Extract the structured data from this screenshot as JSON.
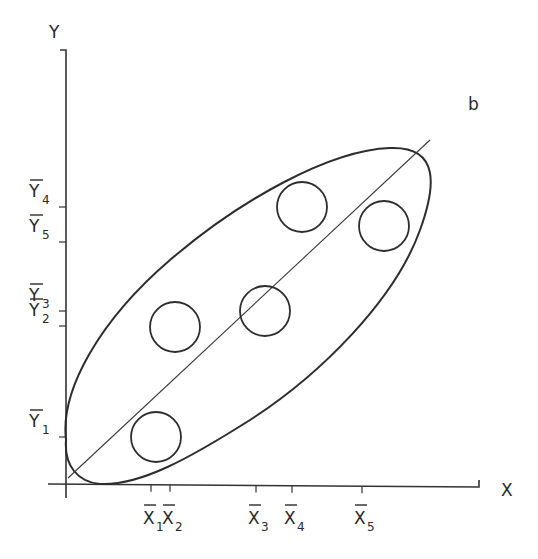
{
  "figure": {
    "panel_label": "b",
    "x_axis_label": "X",
    "y_axis_label": "Y",
    "colors": {
      "ink": "#2d2d2d",
      "background": "#ffffff"
    }
  },
  "x_ticks": [
    {
      "label": "X",
      "sub": "1",
      "pos": 151
    },
    {
      "label": "X",
      "sub": "2",
      "pos": 170
    },
    {
      "label": "X",
      "sub": "3",
      "pos": 256
    },
    {
      "label": "X",
      "sub": "4",
      "pos": 292
    },
    {
      "label": "X",
      "sub": "5",
      "pos": 362
    }
  ],
  "y_ticks": [
    {
      "label": "Y",
      "sub": "4",
      "pos": 207
    },
    {
      "label": "Y",
      "sub": "5",
      "pos": 242
    },
    {
      "label": "Y",
      "sub": "3",
      "pos": 311
    },
    {
      "label": "Y",
      "sub": "2",
      "pos": 326
    },
    {
      "label": "Y",
      "sub": "1",
      "pos": 437
    }
  ],
  "groups": [
    {
      "name": "group-1",
      "cx": 156,
      "cy": 437,
      "r": 25
    },
    {
      "name": "group-2",
      "cx": 175,
      "cy": 327,
      "r": 25
    },
    {
      "name": "group-3",
      "cx": 265,
      "cy": 311,
      "r": 25
    },
    {
      "name": "group-4",
      "cx": 302,
      "cy": 207,
      "r": 25
    },
    {
      "name": "group-5",
      "cx": 384,
      "cy": 226,
      "r": 25
    }
  ],
  "chart_data": {
    "type": "scatter",
    "title": "b",
    "xlabel": "X",
    "ylabel": "Y",
    "points": [
      {
        "group": 1,
        "x_label": "X̄1",
        "y_label": "Ȳ1"
      },
      {
        "group": 2,
        "x_label": "X̄2",
        "y_label": "Ȳ2"
      },
      {
        "group": 3,
        "x_label": "X̄3",
        "y_label": "Ȳ3"
      },
      {
        "group": 4,
        "x_label": "X̄4",
        "y_label": "Ȳ4"
      },
      {
        "group": 5,
        "x_label": "X̄5",
        "y_label": "Ȳ5"
      }
    ],
    "x_order": [
      "X̄1",
      "X̄2",
      "X̄3",
      "X̄4",
      "X̄5"
    ],
    "y_order_bottom_to_top": [
      "Ȳ1",
      "Ȳ2",
      "Ȳ3",
      "Ȳ5",
      "Ȳ4"
    ],
    "grid": false,
    "legend": null
  }
}
